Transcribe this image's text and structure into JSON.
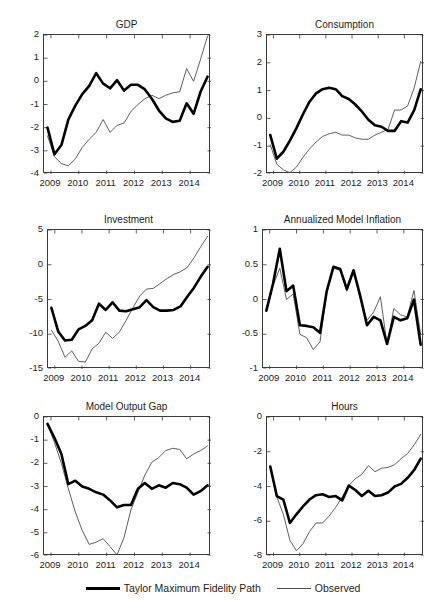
{
  "figure": {
    "title": "",
    "panel_count": 6,
    "legend": {
      "position": "bottom-center",
      "entries": [
        {
          "label": "Taylor Maximum Fidelity Path",
          "style": "thick",
          "color": "#000000"
        },
        {
          "label": "Observed",
          "style": "thin",
          "color": "#4d4d4d"
        }
      ]
    },
    "xticklabels": [
      "2009",
      "2010",
      "2011",
      "2012",
      "2013",
      "2014"
    ]
  },
  "chart_data": [
    {
      "id": "gdp",
      "type": "line",
      "title": "GDP",
      "xlabel": "",
      "ylabel": "",
      "xlim": [
        2008.75,
        2014.75
      ],
      "ylim": [
        -4,
        2
      ],
      "yticks": [
        -4,
        -3,
        -2,
        -1,
        0,
        1,
        2
      ],
      "yticklabels": [
        "-4",
        "-3",
        "-2",
        "-1",
        "0",
        "1",
        "2"
      ],
      "xticks": [
        2009,
        2010,
        2011,
        2012,
        2013,
        2014
      ],
      "xticklabels": [
        "2009",
        "2010",
        "2011",
        "2012",
        "2013",
        "2014"
      ],
      "grid": false,
      "legend": "none",
      "x": [
        2008.875,
        2009.125,
        2009.375,
        2009.625,
        2009.875,
        2010.125,
        2010.375,
        2010.625,
        2010.875,
        2011.125,
        2011.375,
        2011.625,
        2011.875,
        2012.125,
        2012.375,
        2012.625,
        2012.875,
        2013.125,
        2013.375,
        2013.625,
        2013.875,
        2014.125,
        2014.375,
        2014.625
      ],
      "series": [
        {
          "name": "Taylor Maximum Fidelity Path",
          "style": "thick",
          "values": [
            -2.0,
            -3.15,
            -2.75,
            -1.65,
            -1.05,
            -0.55,
            -0.2,
            0.35,
            -0.1,
            -0.3,
            0.05,
            -0.4,
            -0.15,
            -0.15,
            -0.35,
            -0.75,
            -1.25,
            -1.6,
            -1.75,
            -1.7,
            -0.95,
            -1.4,
            -0.45,
            0.2
          ]
        },
        {
          "name": "Observed",
          "style": "thin",
          "values": [
            -2.35,
            -3.25,
            -3.55,
            -3.65,
            -3.35,
            -2.85,
            -2.5,
            -2.2,
            -1.65,
            -2.2,
            -1.9,
            -1.8,
            -1.3,
            -1.0,
            -0.75,
            -0.6,
            -0.75,
            -0.6,
            -0.5,
            -0.45,
            0.55,
            0.0,
            0.95,
            1.95
          ]
        }
      ]
    },
    {
      "id": "consumption",
      "type": "line",
      "title": "Consumption",
      "xlabel": "",
      "ylabel": "",
      "xlim": [
        2008.75,
        2014.75
      ],
      "ylim": [
        -2,
        3
      ],
      "yticks": [
        -2,
        -1,
        0,
        1,
        2,
        3
      ],
      "yticklabels": [
        "-2",
        "-1",
        "0",
        "1",
        "2",
        "3"
      ],
      "xticks": [
        2009,
        2010,
        2011,
        2012,
        2013,
        2014
      ],
      "xticklabels": [
        "2009",
        "2010",
        "2011",
        "2012",
        "2013",
        "2014"
      ],
      "grid": false,
      "legend": "none",
      "x": [
        2008.875,
        2009.125,
        2009.375,
        2009.625,
        2009.875,
        2010.125,
        2010.375,
        2010.625,
        2010.875,
        2011.125,
        2011.375,
        2011.625,
        2011.875,
        2012.125,
        2012.375,
        2012.625,
        2012.875,
        2013.125,
        2013.375,
        2013.625,
        2013.875,
        2014.125,
        2014.375,
        2014.625
      ],
      "series": [
        {
          "name": "Taylor Maximum Fidelity Path",
          "style": "thick",
          "values": [
            -0.6,
            -1.45,
            -1.2,
            -0.8,
            -0.35,
            0.15,
            0.6,
            0.9,
            1.05,
            1.1,
            1.05,
            0.8,
            0.7,
            0.5,
            0.25,
            -0.05,
            -0.25,
            -0.3,
            -0.45,
            -0.45,
            -0.1,
            -0.15,
            0.3,
            1.05
          ]
        },
        {
          "name": "Observed",
          "style": "thin",
          "values": [
            -0.95,
            -1.65,
            -1.85,
            -1.95,
            -1.75,
            -1.4,
            -1.1,
            -0.85,
            -0.65,
            -0.55,
            -0.5,
            -0.6,
            -0.6,
            -0.7,
            -0.75,
            -0.75,
            -0.6,
            -0.5,
            -0.4,
            0.3,
            0.3,
            0.45,
            1.1,
            2.05
          ]
        }
      ]
    },
    {
      "id": "investment",
      "type": "line",
      "title": "Investment",
      "xlabel": "",
      "ylabel": "",
      "xlim": [
        2008.75,
        2014.75
      ],
      "ylim": [
        -15,
        5
      ],
      "yticks": [
        -15,
        -10,
        -5,
        0,
        5
      ],
      "yticklabels": [
        "-15",
        "-10",
        "-5",
        "0",
        "5"
      ],
      "xticks": [
        2009,
        2010,
        2011,
        2012,
        2013,
        2014
      ],
      "xticklabels": [
        "2009",
        "2010",
        "2011",
        "2012",
        "2013",
        "2014"
      ],
      "grid": false,
      "legend": "none",
      "x": [
        2008.875,
        2009.125,
        2009.375,
        2009.625,
        2009.875,
        2010.125,
        2010.375,
        2010.625,
        2010.875,
        2011.125,
        2011.375,
        2011.625,
        2011.875,
        2012.125,
        2012.375,
        2012.625,
        2012.875,
        2013.125,
        2013.375,
        2013.625,
        2013.875,
        2014.125,
        2014.375,
        2014.625
      ],
      "series": [
        {
          "name": "Taylor Maximum Fidelity Path",
          "style": "thick",
          "values": [
            -6.2,
            -9.6,
            -10.9,
            -10.8,
            -9.3,
            -8.8,
            -8.0,
            -5.6,
            -6.5,
            -5.4,
            -6.6,
            -6.7,
            -6.4,
            -6.1,
            -5.1,
            -6.1,
            -6.6,
            -6.6,
            -6.5,
            -6.0,
            -4.6,
            -3.3,
            -1.7,
            -0.3
          ]
        },
        {
          "name": "Observed",
          "style": "thin",
          "values": [
            -9.4,
            -11.0,
            -13.3,
            -12.4,
            -13.9,
            -14.0,
            -12.1,
            -11.3,
            -9.7,
            -10.6,
            -9.7,
            -8.0,
            -6.2,
            -4.5,
            -3.5,
            -3.4,
            -2.7,
            -2.0,
            -1.4,
            -1.0,
            -0.4,
            1.0,
            2.6,
            4.1
          ]
        }
      ]
    },
    {
      "id": "annualized_model_inflation",
      "type": "line",
      "title": "Annualized Model Inflation",
      "xlabel": "",
      "ylabel": "",
      "xlim": [
        2008.75,
        2014.75
      ],
      "ylim": [
        -1,
        1
      ],
      "yticks": [
        -1,
        -0.5,
        0,
        0.5,
        1
      ],
      "yticklabels": [
        "-1",
        "-0.5",
        "0",
        "0.5",
        "1"
      ],
      "xticks": [
        2009,
        2010,
        2011,
        2012,
        2013,
        2014
      ],
      "xticklabels": [
        "2009",
        "2010",
        "2011",
        "2012",
        "2013",
        "2014"
      ],
      "grid": false,
      "legend": "none",
      "x": [
        2008.875,
        2009.125,
        2009.375,
        2009.625,
        2009.875,
        2010.125,
        2010.375,
        2010.625,
        2010.875,
        2011.125,
        2011.375,
        2011.625,
        2011.875,
        2012.125,
        2012.375,
        2012.625,
        2012.875,
        2013.125,
        2013.375,
        2013.625,
        2013.875,
        2014.125,
        2014.375,
        2014.625
      ],
      "series": [
        {
          "name": "Taylor Maximum Fidelity Path",
          "style": "thick",
          "values": [
            -0.16,
            0.23,
            0.73,
            0.12,
            0.2,
            -0.37,
            -0.38,
            -0.4,
            -0.48,
            0.12,
            0.47,
            0.44,
            0.15,
            0.42,
            0.05,
            -0.37,
            -0.25,
            -0.3,
            -0.64,
            -0.25,
            -0.3,
            -0.27,
            0.0,
            -0.65
          ]
        },
        {
          "name": "Observed",
          "style": "thin",
          "values": [
            -0.16,
            0.2,
            0.45,
            0.0,
            0.08,
            -0.5,
            -0.55,
            -0.72,
            -0.61,
            0.1,
            0.45,
            0.42,
            0.12,
            0.41,
            0.0,
            -0.3,
            -0.18,
            0.04,
            -0.65,
            -0.13,
            -0.22,
            -0.25,
            0.13,
            -0.5
          ]
        }
      ]
    },
    {
      "id": "model_output_gap",
      "type": "line",
      "title": "Model Output Gap",
      "xlabel": "",
      "ylabel": "",
      "xlim": [
        2008.75,
        2014.75
      ],
      "ylim": [
        -6,
        0
      ],
      "yticks": [
        -6,
        -5,
        -4,
        -3,
        -2,
        -1,
        0
      ],
      "yticklabels": [
        "-6",
        "-5",
        "-4",
        "-3",
        "-2",
        "-1",
        "0"
      ],
      "xticks": [
        2009,
        2010,
        2011,
        2012,
        2013,
        2014
      ],
      "xticklabels": [
        "2009",
        "2010",
        "2011",
        "2012",
        "2013",
        "2014"
      ],
      "grid": false,
      "legend": "none",
      "x": [
        2008.875,
        2009.125,
        2009.375,
        2009.625,
        2009.875,
        2010.125,
        2010.375,
        2010.625,
        2010.875,
        2011.125,
        2011.375,
        2011.625,
        2011.875,
        2012.125,
        2012.375,
        2012.625,
        2012.875,
        2013.125,
        2013.375,
        2013.625,
        2013.875,
        2014.125,
        2014.375,
        2014.625
      ],
      "series": [
        {
          "name": "Taylor Maximum Fidelity Path",
          "style": "thick",
          "values": [
            -0.3,
            -0.9,
            -1.6,
            -2.9,
            -2.75,
            -3.0,
            -3.1,
            -3.25,
            -3.35,
            -3.6,
            -3.9,
            -3.8,
            -3.8,
            -3.1,
            -2.85,
            -3.1,
            -2.95,
            -3.05,
            -2.85,
            -2.9,
            -3.05,
            -3.35,
            -3.2,
            -2.95
          ]
        },
        {
          "name": "Observed",
          "style": "thin",
          "values": [
            -0.3,
            -1.1,
            -2.0,
            -3.1,
            -4.1,
            -4.9,
            -5.5,
            -5.4,
            -5.25,
            -5.6,
            -5.95,
            -5.2,
            -4.0,
            -3.25,
            -2.5,
            -1.95,
            -1.75,
            -1.45,
            -1.35,
            -1.4,
            -1.8,
            -1.6,
            -1.45,
            -1.25
          ]
        }
      ]
    },
    {
      "id": "hours",
      "type": "line",
      "title": "Hours",
      "xlabel": "",
      "ylabel": "",
      "xlim": [
        2008.75,
        2014.75
      ],
      "ylim": [
        -8,
        0
      ],
      "yticks": [
        -8,
        -6,
        -4,
        -2,
        0
      ],
      "yticklabels": [
        "-8",
        "-6",
        "-4",
        "-2",
        "0"
      ],
      "xticks": [
        2009,
        2010,
        2011,
        2012,
        2013,
        2014
      ],
      "xticklabels": [
        "2009",
        "2010",
        "2011",
        "2012",
        "2013",
        "2014"
      ],
      "grid": false,
      "legend": "none",
      "x": [
        2008.875,
        2009.125,
        2009.375,
        2009.625,
        2009.875,
        2010.125,
        2010.375,
        2010.625,
        2010.875,
        2011.125,
        2011.375,
        2011.625,
        2011.875,
        2012.125,
        2012.375,
        2012.625,
        2012.875,
        2013.125,
        2013.375,
        2013.625,
        2013.875,
        2014.125,
        2014.375,
        2014.625
      ],
      "series": [
        {
          "name": "Taylor Maximum Fidelity Path",
          "style": "thick",
          "values": [
            -2.85,
            -4.55,
            -4.75,
            -6.1,
            -5.6,
            -5.15,
            -4.75,
            -4.5,
            -4.45,
            -4.6,
            -4.55,
            -4.8,
            -3.95,
            -4.2,
            -4.55,
            -4.25,
            -4.55,
            -4.5,
            -4.35,
            -4.0,
            -3.85,
            -3.5,
            -3.05,
            -2.4
          ]
        },
        {
          "name": "Observed",
          "style": "thin",
          "values": [
            -2.85,
            -4.6,
            -5.6,
            -7.1,
            -7.7,
            -7.3,
            -6.6,
            -6.1,
            -6.1,
            -5.7,
            -5.2,
            -4.6,
            -3.95,
            -3.55,
            -3.3,
            -2.8,
            -3.15,
            -2.95,
            -2.9,
            -2.75,
            -2.4,
            -2.1,
            -1.6,
            -1.0
          ]
        }
      ]
    }
  ]
}
